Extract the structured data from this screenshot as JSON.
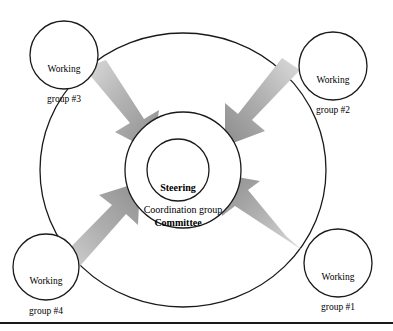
{
  "diagram": {
    "title_text_center": "Steering\nCommittee",
    "center": {
      "line1": "Steering",
      "line2": "Committee"
    },
    "coordination": {
      "label": "Coordination group"
    },
    "working_groups": [
      {
        "id": "wg3",
        "line1": "Working",
        "line2": "group #3",
        "cx": 64,
        "cy": 55,
        "r": 34
      },
      {
        "id": "wg2",
        "line1": "Working",
        "line2": "group #2",
        "cx": 333,
        "cy": 66,
        "r": 34
      },
      {
        "id": "wg1",
        "line1": "Working",
        "line2": "group #1",
        "cx": 338,
        "cy": 263,
        "r": 34
      },
      {
        "id": "wg4",
        "line1": "Working",
        "line2": "group #4",
        "cx": 46,
        "cy": 267,
        "r": 33
      }
    ],
    "circles": {
      "outer": {
        "cx": 183,
        "cy": 170,
        "rx": 143,
        "ry": 137
      },
      "middle": {
        "cx": 183,
        "cy": 170,
        "r": 58
      },
      "inner": {
        "cx": 178,
        "cy": 170,
        "r": 31
      }
    },
    "arrows": [
      {
        "id": "arrow-from-wg3",
        "direction": "down-right"
      },
      {
        "id": "arrow-from-wg2",
        "direction": "down-left"
      },
      {
        "id": "arrow-from-wg1",
        "direction": "up-left"
      },
      {
        "id": "arrow-from-wg4",
        "direction": "up-right"
      }
    ],
    "colors": {
      "stroke": "#1a1a1a",
      "background": "#ffffff",
      "arrow_light": "#d8d8d8",
      "arrow_mid": "#a8a8a8",
      "arrow_dark": "#8d8d8d",
      "text": "#000000",
      "rule": "#1a1a1a"
    },
    "bottom_rule": {
      "y": 322
    }
  }
}
